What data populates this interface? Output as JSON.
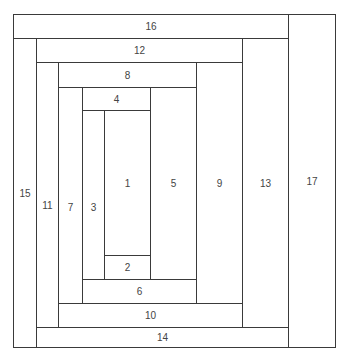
{
  "diagram": {
    "line_color": "#3a3a3a",
    "text_color": "#444444",
    "blocks": [
      {
        "label": "1",
        "x1": 104,
        "y1": 110,
        "x2": 150,
        "y2": 255
      },
      {
        "label": "2",
        "x1": 104,
        "y1": 255,
        "x2": 150,
        "y2": 279
      },
      {
        "label": "3",
        "x1": 82,
        "y1": 110,
        "x2": 104,
        "y2": 303
      },
      {
        "label": "4",
        "x1": 82,
        "y1": 87,
        "x2": 150,
        "y2": 110
      },
      {
        "label": "5",
        "x1": 150,
        "y1": 87,
        "x2": 196,
        "y2": 279
      },
      {
        "label": "6",
        "x1": 82,
        "y1": 279,
        "x2": 196,
        "y2": 303
      },
      {
        "label": "7",
        "x1": 58,
        "y1": 87,
        "x2": 82,
        "y2": 327
      },
      {
        "label": "8",
        "x1": 58,
        "y1": 62,
        "x2": 196,
        "y2": 87
      },
      {
        "label": "9",
        "x1": 196,
        "y1": 62,
        "x2": 242,
        "y2": 303
      },
      {
        "label": "10",
        "x1": 58,
        "y1": 303,
        "x2": 242,
        "y2": 327
      },
      {
        "label": "11",
        "x1": 36,
        "y1": 62,
        "x2": 58,
        "y2": 347
      },
      {
        "label": "12",
        "x1": 36,
        "y1": 38,
        "x2": 242,
        "y2": 62
      },
      {
        "label": "13",
        "x1": 242,
        "y1": 38,
        "x2": 288,
        "y2": 327
      },
      {
        "label": "14",
        "x1": 36,
        "y1": 327,
        "x2": 288,
        "y2": 347
      },
      {
        "label": "15",
        "x1": 13,
        "y1": 38,
        "x2": 36,
        "y2": 347
      },
      {
        "label": "16",
        "x1": 13,
        "y1": 14,
        "x2": 288,
        "y2": 38
      },
      {
        "label": "17",
        "x1": 288,
        "y1": 14,
        "x2": 335,
        "y2": 347
      }
    ]
  }
}
